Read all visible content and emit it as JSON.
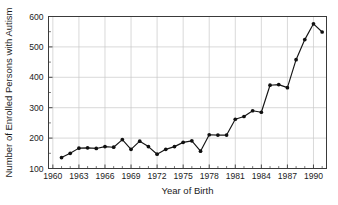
{
  "chart_data": {
    "type": "line",
    "title": "",
    "xlabel": "Year of Birth",
    "ylabel": "Number of Enrolled Persons with Autism",
    "xlim": [
      1959.5,
      1991.5
    ],
    "ylim": [
      100,
      600
    ],
    "grid": true,
    "legend": false,
    "x_major_ticks": [
      1960,
      1963,
      1966,
      1969,
      1972,
      1975,
      1978,
      1981,
      1984,
      1987,
      1990
    ],
    "x_tick_labels": [
      "1960",
      "1963",
      "1966",
      "1969",
      "1972",
      "1975",
      "1978",
      "1981",
      "1984",
      "1987",
      "1990"
    ],
    "x_minor_tick_step": 1,
    "y_major_ticks": [
      100,
      200,
      300,
      400,
      500,
      600
    ],
    "y_tick_labels": [
      "100",
      "200",
      "300",
      "400",
      "500",
      "600"
    ],
    "y_minor_ticks": [
      150,
      250,
      350,
      450,
      550
    ],
    "series_name": "Enrolled persons with autism",
    "marker": "filled-circle",
    "line_color": "#151515",
    "marker_color": "#101010",
    "grid_color": "#c9c9c9",
    "x": [
      1961,
      1962,
      1963,
      1964,
      1965,
      1966,
      1967,
      1968,
      1969,
      1970,
      1971,
      1972,
      1973,
      1974,
      1975,
      1976,
      1977,
      1978,
      1979,
      1980,
      1981,
      1982,
      1983,
      1984,
      1985,
      1986,
      1987,
      1988,
      1989,
      1990,
      1991
    ],
    "values": [
      136,
      150,
      167,
      168,
      166,
      172,
      170,
      195,
      163,
      190,
      172,
      147,
      163,
      172,
      186,
      191,
      157,
      211,
      210,
      210,
      262,
      271,
      290,
      285,
      374,
      376,
      366,
      458,
      524,
      576,
      549
    ]
  },
  "figure": {
    "background_color": "#ffffff",
    "axis_color": "#3a3a3a",
    "text_color": "#1c1c1c"
  }
}
